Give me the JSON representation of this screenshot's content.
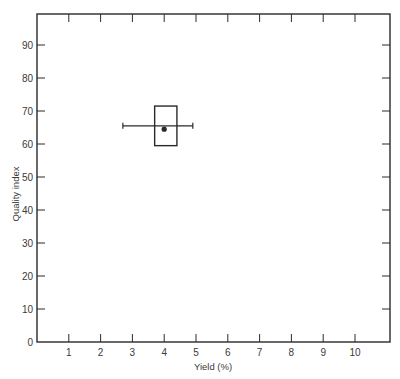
{
  "chart_data": {
    "type": "scatter",
    "title": "",
    "xlabel": "Yield (%)",
    "ylabel": "Quality index",
    "xlim": [
      0,
      11
    ],
    "ylim": [
      0,
      98
    ],
    "x_ticks": [
      1,
      2,
      3,
      4,
      5,
      6,
      7,
      8,
      9,
      10
    ],
    "y_ticks": [
      0,
      10,
      20,
      30,
      40,
      50,
      60,
      70,
      80,
      90
    ],
    "grid": false,
    "legend": null,
    "series": [
      {
        "name": "estimate",
        "point": {
          "x": 4.0,
          "y": 64.5
        },
        "box": {
          "x_min": 3.7,
          "x_max": 4.4,
          "y_min": 59.5,
          "y_max": 71.5
        },
        "whisker": {
          "x_min": 2.7,
          "x_max": 4.9,
          "y": 65.5
        }
      }
    ]
  },
  "colors": {
    "ink": "#2a2a2a",
    "label": "#3a3a3a",
    "background": "#ffffff"
  }
}
